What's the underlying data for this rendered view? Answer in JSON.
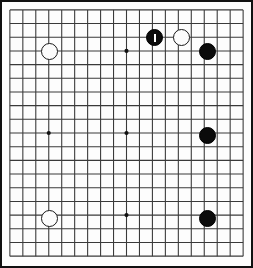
{
  "board": {
    "title": "Go board diagram",
    "game": "Go",
    "size": 19,
    "columns": 19,
    "rows": 19,
    "grid_color": "#3a3a3a",
    "border_color": "#111111",
    "background_color": "#fdfdfd",
    "black_color": "#0b0b0b",
    "white_color": "#fcfcfc",
    "star_points": [
      {
        "col": 3,
        "row": 3
      },
      {
        "col": 9,
        "row": 3
      },
      {
        "col": 15,
        "row": 3
      },
      {
        "col": 3,
        "row": 9
      },
      {
        "col": 9,
        "row": 9
      },
      {
        "col": 15,
        "row": 9
      },
      {
        "col": 3,
        "row": 15
      },
      {
        "col": 9,
        "row": 15
      },
      {
        "col": 15,
        "row": 15
      }
    ],
    "visible_star_points": [
      {
        "col": 3,
        "row": 9
      },
      {
        "col": 9,
        "row": 3
      },
      {
        "col": 9,
        "row": 9
      },
      {
        "col": 9,
        "row": 15
      }
    ],
    "stones": [
      {
        "color": "white",
        "col": 3,
        "row": 3,
        "marked": false,
        "mark": ""
      },
      {
        "color": "black",
        "col": 11,
        "row": 2,
        "marked": true,
        "mark": "last-move-tick"
      },
      {
        "color": "white",
        "col": 13,
        "row": 2,
        "marked": false,
        "mark": ""
      },
      {
        "color": "black",
        "col": 15,
        "row": 3,
        "marked": false,
        "mark": ""
      },
      {
        "color": "black",
        "col": 15,
        "row": 9,
        "marked": false,
        "mark": ""
      },
      {
        "color": "white",
        "col": 3,
        "row": 15,
        "marked": false,
        "mark": ""
      },
      {
        "color": "black",
        "col": 15,
        "row": 15,
        "marked": false,
        "mark": ""
      }
    ],
    "counts": {
      "black_stones": 4,
      "white_stones": 3,
      "total_stones": 7
    }
  }
}
